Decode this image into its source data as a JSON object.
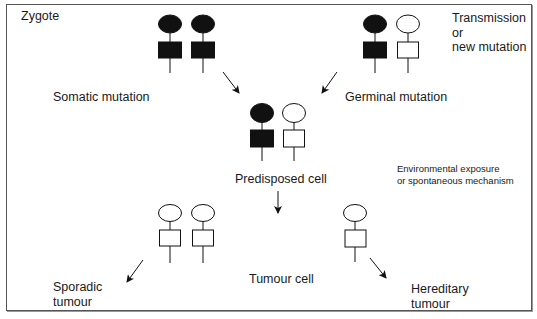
{
  "labels": {
    "zygote": "Zygote",
    "transmission": "Transmission\nor\nnew mutation",
    "somatic_mutation": "Somatic mutation",
    "germinal_mutation": "Germinal mutation",
    "predisposed_cell": "Predisposed cell",
    "environmental": "Environmental exposure\nor spontaneous mechanism",
    "tumour_cell": "Tumour cell",
    "sporadic_tumour": "Sporadic\ntumour",
    "hereditary_tumour": "Hereditary\ntumour"
  },
  "colors": {
    "ink": "#111111",
    "border": "#555555",
    "background": "#ffffff"
  },
  "allele_pairs": [
    {
      "name": "zygote-somatic-pair",
      "alleles": [
        {
          "x": 170,
          "filled": true
        },
        {
          "x": 203,
          "filled": true
        }
      ],
      "y": 24
    },
    {
      "name": "zygote-germinal-pair",
      "alleles": [
        {
          "x": 375,
          "filled": true
        },
        {
          "x": 408,
          "filled": false
        }
      ],
      "y": 24
    },
    {
      "name": "predisposed-cell-pair",
      "alleles": [
        {
          "x": 262,
          "filled": true
        },
        {
          "x": 294,
          "filled": false
        }
      ],
      "y": 113
    },
    {
      "name": "sporadic-tumour-cell-pair",
      "alleles": [
        {
          "x": 170,
          "filled": false
        },
        {
          "x": 203,
          "filled": false
        }
      ],
      "y": 213
    },
    {
      "name": "hereditary-tumour-cell",
      "alleles": [
        {
          "x": 355,
          "filled": false
        }
      ],
      "y": 213
    }
  ]
}
